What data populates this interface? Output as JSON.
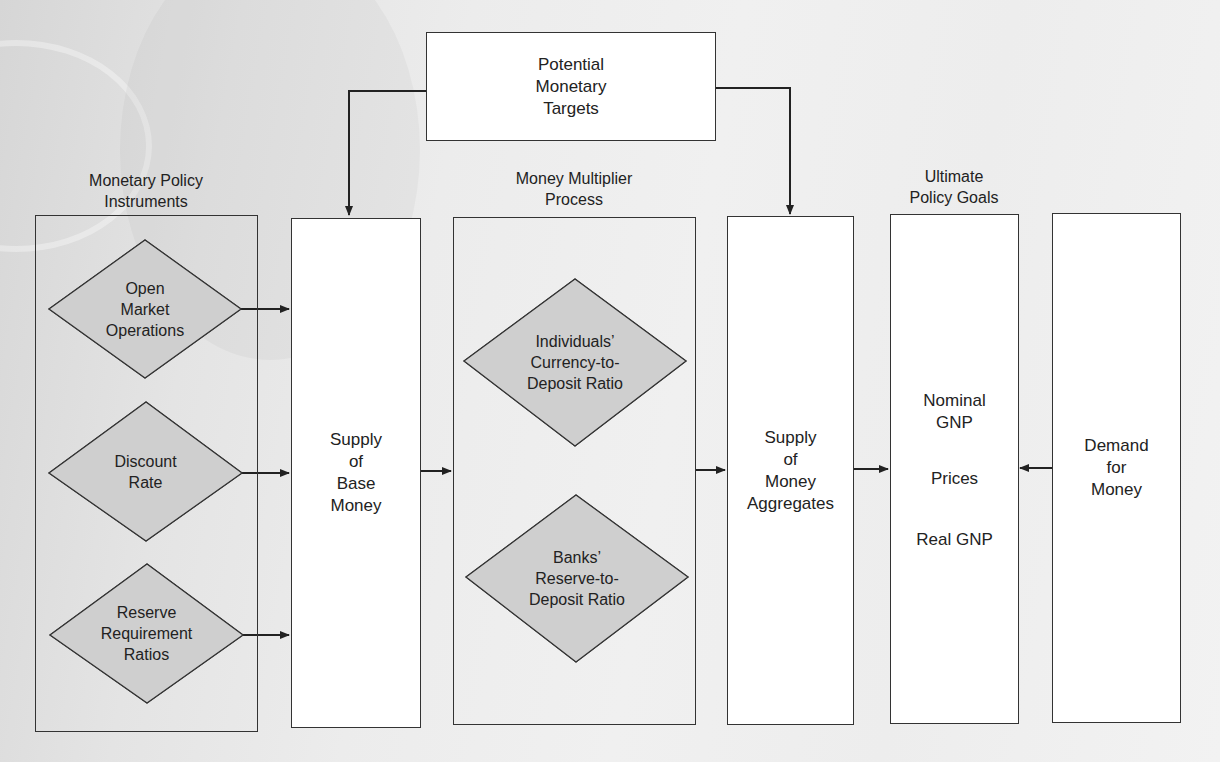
{
  "diagram": {
    "top_box": {
      "lines": [
        "Potential",
        "Monetary",
        "Targets"
      ]
    },
    "column_headers": {
      "instruments": [
        "Monetary Policy",
        "Instruments"
      ],
      "multiplier": [
        "Money Multiplier",
        "Process"
      ],
      "goals": [
        "Ultimate",
        "Policy Goals"
      ]
    },
    "instruments": [
      {
        "lines": [
          "Open",
          "Market",
          "Operations"
        ]
      },
      {
        "lines": [
          "Discount",
          "Rate"
        ]
      },
      {
        "lines": [
          "Reserve",
          "Requirement",
          "Ratios"
        ]
      }
    ],
    "base_money": {
      "lines": [
        "Supply",
        "of",
        "Base",
        "Money"
      ]
    },
    "multiplier_factors": [
      {
        "lines": [
          "Individuals’",
          "Currency-to-",
          "Deposit Ratio"
        ]
      },
      {
        "lines": [
          "Banks’",
          "Reserve-to-",
          "Deposit Ratio"
        ]
      }
    ],
    "money_aggregates": {
      "lines": [
        "Supply",
        "of",
        "Money",
        "Aggregates"
      ]
    },
    "goals": {
      "items": [
        {
          "lines": [
            "Nominal",
            "GNP"
          ]
        },
        {
          "lines": [
            "Prices"
          ]
        },
        {
          "lines": [
            "Real GNP"
          ]
        }
      ]
    },
    "demand": {
      "lines": [
        "Demand",
        "for",
        "Money"
      ]
    }
  },
  "colors": {
    "diamond_fill": "#cfcfcf",
    "stroke": "#333333",
    "box_fill": "#ffffff"
  }
}
